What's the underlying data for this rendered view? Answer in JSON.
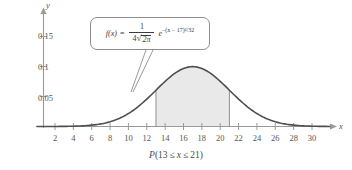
{
  "chart_data": {
    "type": "area",
    "title": "",
    "subtitle": "",
    "xlabel": "x",
    "ylabel": "y",
    "xlim": [
      0,
      32
    ],
    "ylim": [
      0,
      0.175
    ],
    "grid": false,
    "legend": null,
    "curve": {
      "name": "normal-density",
      "formula_plain": "f(x) = 1/(4*sqrt(2*pi)) * e^(-(x-17)^2/32)",
      "mean": 17,
      "std_dev": 4,
      "peak_value": 0.0997,
      "peak_x": 17
    },
    "shaded_region": {
      "from": 13,
      "to": 21,
      "fill_color": "#e9e9e9",
      "label": "P(13 <= x <= 21)"
    },
    "x_ticks": [
      2,
      4,
      6,
      8,
      10,
      12,
      14,
      16,
      18,
      20,
      22,
      24,
      26,
      28,
      30
    ],
    "x_tick_labels": [
      "2",
      "4",
      "6",
      "8",
      "10",
      "12",
      "14",
      "16",
      "18",
      "20",
      "22",
      "24",
      "26",
      "28",
      "30"
    ],
    "y_ticks": [
      0.05,
      0.1,
      0.15
    ],
    "y_tick_labels": [
      "0.05",
      "0.1",
      "0.15"
    ],
    "series": [
      {
        "name": "f(x)",
        "x": [
          0,
          1,
          2,
          3,
          4,
          5,
          6,
          7,
          8,
          9,
          10,
          11,
          12,
          13,
          14,
          15,
          16,
          17,
          18,
          19,
          20,
          21,
          22,
          23,
          24,
          25,
          26,
          27,
          28,
          29,
          30,
          31,
          32
        ],
        "values": [
          0.0,
          0.0001,
          0.0002,
          0.0004,
          0.0009,
          0.0018,
          0.0033,
          0.0058,
          0.0094,
          0.0144,
          0.021,
          0.029,
          0.038,
          0.047,
          0.0549,
          0.0607,
          0.0635,
          0.0635,
          0.0607,
          0.0549,
          0.047,
          0.038,
          0.029,
          0.021,
          0.0144,
          0.0094,
          0.0058,
          0.0033,
          0.0018,
          0.0009,
          0.0004,
          0.0002,
          0.0001
        ]
      }
    ]
  },
  "axes": {
    "x_axis_name": "x",
    "y_axis_name": "y",
    "x_tick_labels": [
      "2",
      "4",
      "6",
      "8",
      "10",
      "12",
      "14",
      "16",
      "18",
      "20",
      "22",
      "24",
      "26",
      "28",
      "30"
    ],
    "y_tick_labels": [
      "0.15",
      "0.1",
      "0.05"
    ]
  },
  "callout": {
    "name": "density-formula",
    "f_of_x": "f(x)",
    "equals": "=",
    "numerator": "1",
    "denominator_coefficient": "4",
    "sqrt_symbol": "√",
    "radicand": "2π",
    "e_base": "e",
    "exponent": "−(x − 17)²/32",
    "exponent_inline": "-(x - 17)^2/32"
  },
  "caption": {
    "prefix": "P",
    "open": "(",
    "lower_bound": "13",
    "le_1": "≤",
    "variable": "x",
    "le_2": "≤",
    "upper_bound": "21",
    "close": ")",
    "full_text": "P(13 ≤ x ≤ 21)"
  },
  "colors": {
    "curve": "#555555",
    "axis": "#9a9a9a",
    "shade": "#e9e9e9",
    "boundary_line": "#9a9a9a",
    "text": "#4a4a4a",
    "callout_border": "#8c8c8c"
  }
}
